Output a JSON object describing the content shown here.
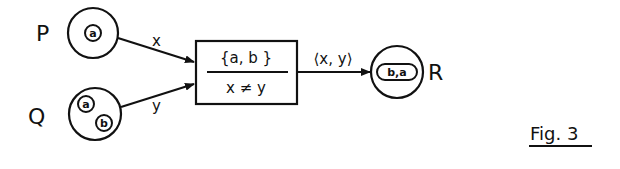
{
  "figure": {
    "caption": "Fig. 3",
    "places": [
      {
        "id": "P",
        "label": "P",
        "tokens": [
          "a"
        ]
      },
      {
        "id": "Q",
        "label": "Q",
        "tokens": [
          "a",
          "b"
        ]
      },
      {
        "id": "R",
        "label": "R",
        "tokens": [
          "b,a"
        ]
      }
    ],
    "transition": {
      "top": "{a, b }",
      "bottom": "x ≠ y"
    },
    "arcs": [
      {
        "from": "P",
        "to": "transition",
        "label": "x"
      },
      {
        "from": "Q",
        "to": "transition",
        "label": "y"
      },
      {
        "from": "transition",
        "to": "R",
        "label": "⟨x, y⟩"
      }
    ]
  },
  "colors": {
    "ink": "#111111",
    "background": "#ffffff"
  }
}
